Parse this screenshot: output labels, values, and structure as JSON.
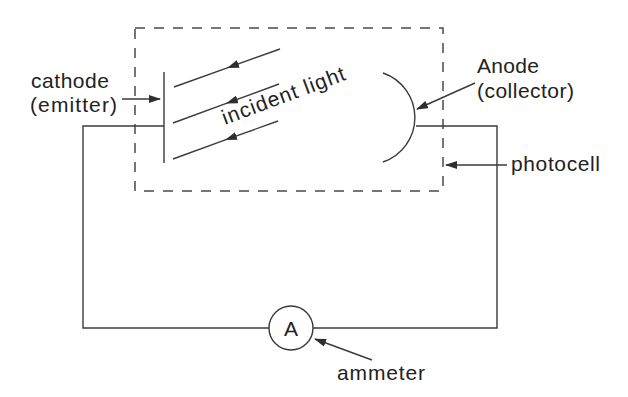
{
  "diagram": {
    "type": "photoelectric-circuit",
    "labels": {
      "cathode": {
        "line1": "cathode",
        "line2": "(emitter)"
      },
      "anode": {
        "line1": "Anode",
        "line2": "(collector)"
      },
      "photocell": "photocell",
      "ammeter": "ammeter",
      "incident_light": "incident light",
      "ammeter_symbol": "A"
    },
    "components": [
      {
        "id": "cathode",
        "label": "cathode (emitter)",
        "shape": "vertical-plate"
      },
      {
        "id": "anode",
        "label": "Anode (collector)",
        "shape": "arc"
      },
      {
        "id": "photocell",
        "label": "photocell",
        "shape": "dashed-rectangle"
      },
      {
        "id": "ammeter",
        "label": "ammeter",
        "shape": "circle",
        "symbol": "A"
      },
      {
        "id": "incident-light",
        "label": "incident light",
        "shape": "arrows",
        "count": 3
      }
    ],
    "connections": [
      {
        "from": "cathode",
        "to": "ammeter"
      },
      {
        "from": "ammeter",
        "to": "anode"
      }
    ]
  },
  "colors": {
    "background": "#ffffff",
    "line": "#3a3a3a",
    "text": "#222222"
  }
}
